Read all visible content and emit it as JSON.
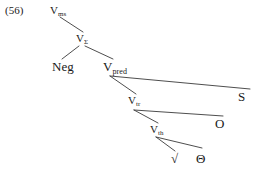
{
  "figure": {
    "example_number": "(56)",
    "width": 258,
    "height": 175,
    "background_color": "#ffffff",
    "line_color": "#3a3a3a",
    "text_color": "#1a1a1a",
    "type": "syntax-tree"
  },
  "nodes": {
    "vms": {
      "base": "V",
      "sub": "ms",
      "label": "Vms"
    },
    "vsigma": {
      "base": "V",
      "sub": "Σ",
      "label": "VΣ"
    },
    "neg": {
      "base": "Neg",
      "sub": "",
      "label": "Neg"
    },
    "vpred": {
      "base": "V",
      "sub": "pred",
      "label": "Vpred"
    },
    "s": {
      "base": "S",
      "sub": "",
      "label": "S"
    },
    "vtr": {
      "base": "V",
      "sub": "tr",
      "label": "Vtr"
    },
    "o": {
      "base": "O",
      "sub": "",
      "label": "O"
    },
    "vth": {
      "base": "V",
      "sub": "th",
      "label": "Vth"
    },
    "root": {
      "base": "√",
      "sub": "",
      "label": "√"
    },
    "theta": {
      "base": "Θ",
      "sub": "",
      "label": "Θ"
    }
  },
  "edges": [
    {
      "from": "vms",
      "to": "vsigma",
      "x1": 60,
      "y1": 17,
      "x2": 83,
      "y2": 32
    },
    {
      "from": "vsigma",
      "to": "neg",
      "x1": 79,
      "y1": 46,
      "x2": 62,
      "y2": 59
    },
    {
      "from": "vsigma",
      "to": "vpred",
      "x1": 85,
      "y1": 46,
      "x2": 113,
      "y2": 59
    },
    {
      "from": "vpred",
      "to": "vtr",
      "x1": 110,
      "y1": 76,
      "x2": 136,
      "y2": 94
    },
    {
      "from": "vpred",
      "to": "s",
      "x1": 110,
      "y1": 76,
      "x2": 250,
      "y2": 89
    },
    {
      "from": "vtr",
      "to": "vth",
      "x1": 134,
      "y1": 110,
      "x2": 158,
      "y2": 123
    },
    {
      "from": "vtr",
      "to": "o",
      "x1": 134,
      "y1": 110,
      "x2": 223,
      "y2": 116
    },
    {
      "from": "vth",
      "to": "root",
      "x1": 156,
      "y1": 137,
      "x2": 175,
      "y2": 151
    },
    {
      "from": "vth",
      "to": "theta",
      "x1": 156,
      "y1": 137,
      "x2": 202,
      "y2": 148
    }
  ]
}
